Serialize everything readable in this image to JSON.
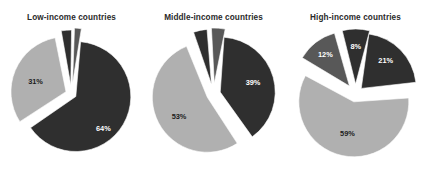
{
  "figure": {
    "background": "#ffffff",
    "colors": {
      "dark": "#2f2f2f",
      "medium": "#585858",
      "light": "#b0b0b0",
      "label_on_dark": "#ffffff",
      "label_on_light": "#1c1c1c",
      "title": "#2a2a2a"
    }
  },
  "chart_data": [
    {
      "type": "pie",
      "title": "Low-income countries",
      "xlabel": "",
      "ylabel": "",
      "legend": "none",
      "grid": false,
      "exploded": true,
      "categories": [
        "64%",
        "31%",
        "3%",
        "2%"
      ],
      "values": [
        64,
        31,
        3,
        2
      ],
      "labels": [
        "64%",
        "31%",
        "3%",
        "2%"
      ],
      "slice_colors": [
        "#2f2f2f",
        "#b0b0b0",
        "#2f2f2f",
        "#585858"
      ]
    },
    {
      "type": "pie",
      "title": "Middle-income countries",
      "xlabel": "",
      "ylabel": "",
      "legend": "none",
      "grid": false,
      "exploded": true,
      "categories": [
        "39%",
        "53%",
        "4%",
        "4%"
      ],
      "values": [
        39,
        53,
        4,
        4
      ],
      "labels": [
        "39%",
        "53%",
        "4%",
        "4%"
      ],
      "slice_colors": [
        "#2f2f2f",
        "#b0b0b0",
        "#2f2f2f",
        "#585858"
      ]
    },
    {
      "type": "pie",
      "title": "High-income countries",
      "xlabel": "",
      "ylabel": "",
      "legend": "none",
      "grid": false,
      "exploded": true,
      "categories": [
        "21%",
        "59%",
        "12%",
        "8%"
      ],
      "values": [
        21,
        59,
        12,
        8
      ],
      "labels": [
        "21%",
        "59%",
        "12%",
        "8%"
      ],
      "slice_colors": [
        "#2f2f2f",
        "#b0b0b0",
        "#585858",
        "#2f2f2f"
      ]
    }
  ],
  "panels": [
    {
      "title": "Low-income countries",
      "slices": [
        {
          "name": "slice-64",
          "label": "64%",
          "value": 64,
          "color": "#2f2f2f",
          "start": 5,
          "sweep": 230.4,
          "explode": 5,
          "lx": 0.58,
          "ly": 0.3,
          "on_dark": true
        },
        {
          "name": "slice-31",
          "label": "31%",
          "value": 31,
          "color": "#b0b0b0",
          "start": 237,
          "sweep": 111.6,
          "explode": 6,
          "lx": 0.6,
          "ly": 0.05,
          "on_dark": false
        },
        {
          "name": "slice-3",
          "label": "3%",
          "value": 3,
          "color": "#2f2f2f",
          "start": 350,
          "sweep": 10.8,
          "explode": 9,
          "lx": 1.22,
          "ly": -0.02,
          "on_dark": false
        },
        {
          "name": "slice-2",
          "label": "2%",
          "value": 2,
          "color": "#585858",
          "start": 362,
          "sweep": 7.2,
          "explode": 11,
          "lx": 1.46,
          "ly": 0.18,
          "on_dark": false
        }
      ]
    },
    {
      "title": "Middle-income countries",
      "slices": [
        {
          "name": "slice-39",
          "label": "39%",
          "value": 39,
          "color": "#2f2f2f",
          "start": 4,
          "sweep": 140.4,
          "explode": 7,
          "lx": 0.62,
          "ly": 0.0,
          "on_dark": true
        },
        {
          "name": "slice-53",
          "label": "53%",
          "value": 53,
          "color": "#b0b0b0",
          "start": 147,
          "sweep": 190.8,
          "explode": 7,
          "lx": 0.58,
          "ly": 0.1,
          "on_dark": false
        },
        {
          "name": "slice-4a",
          "label": "4%",
          "value": 4,
          "color": "#2f2f2f",
          "start": 341,
          "sweep": 14.4,
          "explode": 10,
          "lx": 1.24,
          "ly": -0.04,
          "on_dark": false
        },
        {
          "name": "slice-4b",
          "label": "4%",
          "value": 4,
          "color": "#585858",
          "start": 357,
          "sweep": 14.4,
          "explode": 11,
          "lx": 1.3,
          "ly": 0.04,
          "on_dark": false
        }
      ]
    },
    {
      "title": "High-income countries",
      "slices": [
        {
          "name": "slice-21",
          "label": "21%",
          "value": 21,
          "color": "#2f2f2f",
          "start": 8,
          "sweep": 75.6,
          "explode": 8,
          "lx": 0.62,
          "ly": -0.06,
          "on_dark": true
        },
        {
          "name": "slice-59",
          "label": "59%",
          "value": 59,
          "color": "#b0b0b0",
          "start": 86,
          "sweep": 212.4,
          "explode": 8,
          "lx": 0.55,
          "ly": 0.04,
          "on_dark": false
        },
        {
          "name": "slice-12",
          "label": "12%",
          "value": 12,
          "color": "#585858",
          "start": 301,
          "sweep": 43.2,
          "explode": 10,
          "lx": 0.72,
          "ly": 0.0,
          "on_dark": true
        },
        {
          "name": "slice-8",
          "label": "8%",
          "value": 8,
          "color": "#2f2f2f",
          "start": 346,
          "sweep": 28.8,
          "explode": 10,
          "lx": 0.7,
          "ly": 0.02,
          "on_dark": true
        }
      ]
    }
  ]
}
